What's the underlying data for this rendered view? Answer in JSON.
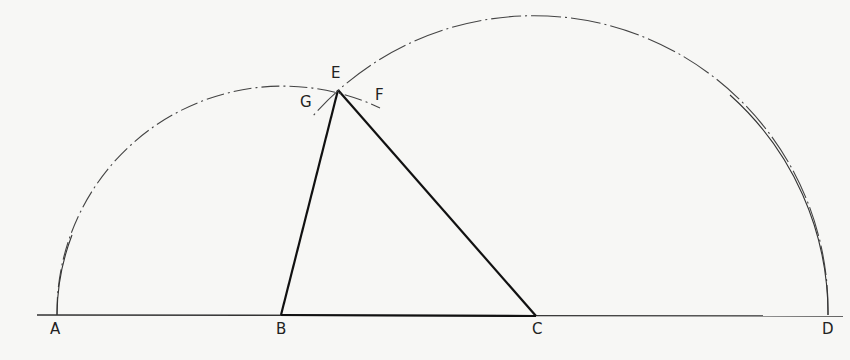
{
  "diagram": {
    "points": {
      "A": {
        "label": "A"
      },
      "B": {
        "label": "B"
      },
      "C": {
        "label": "C"
      },
      "D": {
        "label": "D"
      },
      "E": {
        "label": "E"
      },
      "F": {
        "label": "F"
      },
      "G": {
        "label": "G"
      }
    },
    "segments": [
      "AD",
      "BE",
      "CE",
      "BC"
    ],
    "arcs": [
      {
        "name": "arc-centered-B-through-A",
        "center": "B",
        "through": "A",
        "style": "dash-dot"
      },
      {
        "name": "arc-centered-C-through-D",
        "center": "C",
        "through": "D",
        "style": "dash-dot"
      }
    ],
    "colors": {
      "ink": "#222222",
      "paper": "#f7f7f5"
    }
  }
}
